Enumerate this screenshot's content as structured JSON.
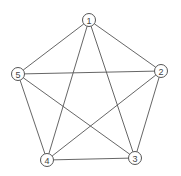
{
  "diagram": {
    "type": "complete-graph",
    "name": "K5",
    "nodes": [
      {
        "id": "1",
        "label": "1",
        "x": 89,
        "y": 20
      },
      {
        "id": "2",
        "label": "2",
        "x": 161,
        "y": 71
      },
      {
        "id": "3",
        "label": "3",
        "x": 135,
        "y": 158
      },
      {
        "id": "4",
        "label": "4",
        "x": 47,
        "y": 160
      },
      {
        "id": "5",
        "label": "5",
        "x": 18,
        "y": 74
      }
    ],
    "edges": [
      [
        "1",
        "2"
      ],
      [
        "1",
        "3"
      ],
      [
        "1",
        "4"
      ],
      [
        "1",
        "5"
      ],
      [
        "2",
        "3"
      ],
      [
        "2",
        "4"
      ],
      [
        "2",
        "5"
      ],
      [
        "3",
        "4"
      ],
      [
        "3",
        "5"
      ],
      [
        "4",
        "5"
      ]
    ],
    "node_radius": 6.5,
    "colors": {
      "line": "#555555",
      "label": "#444444",
      "background": "#ffffff"
    }
  }
}
